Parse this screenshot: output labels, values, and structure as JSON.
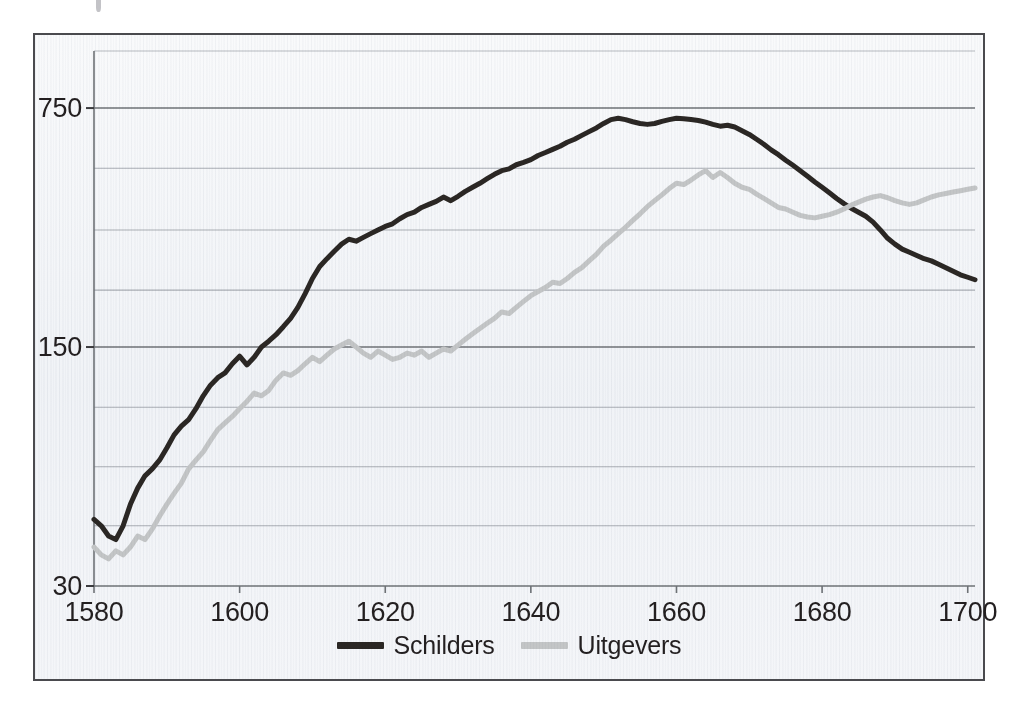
{
  "figure": {
    "frame_border_color": "#4a4a4e",
    "background_color": "#f2f4f7",
    "top_artifact_name": "scan-artifact-mark"
  },
  "legend": {
    "position": "bottom-center",
    "entries": [
      {
        "label": "Schilders",
        "color": "#2b2724",
        "swatch_name": "legend-swatch-schilders"
      },
      {
        "label": "Uitgevers",
        "color": "#c3c5c6",
        "swatch_name": "legend-swatch-uitgevers"
      }
    ]
  },
  "chart_data": {
    "type": "line",
    "title": "",
    "subtitle": "",
    "xlabel": "",
    "ylabel": "",
    "xlim": [
      1580,
      1701
    ],
    "ylim": [
      30,
      900
    ],
    "yscale": "log",
    "grid": true,
    "gridlines_y": [
      750,
      500,
      330,
      220,
      150,
      100,
      67,
      45,
      30
    ],
    "y_tick_labels": [
      "750",
      "150",
      "30"
    ],
    "y_ticks": [
      750,
      150,
      30
    ],
    "x_ticks": [
      1580,
      1600,
      1620,
      1640,
      1660,
      1680,
      1700
    ],
    "x_tick_labels": [
      "1580",
      "1600",
      "1620",
      "1640",
      "1660",
      "1680",
      "1700"
    ],
    "x": [
      1580,
      1581,
      1582,
      1583,
      1584,
      1585,
      1586,
      1587,
      1588,
      1589,
      1590,
      1591,
      1592,
      1593,
      1594,
      1595,
      1596,
      1597,
      1598,
      1599,
      1600,
      1601,
      1602,
      1603,
      1604,
      1605,
      1606,
      1607,
      1608,
      1609,
      1610,
      1611,
      1612,
      1613,
      1614,
      1615,
      1616,
      1617,
      1618,
      1619,
      1620,
      1621,
      1622,
      1623,
      1624,
      1625,
      1626,
      1627,
      1628,
      1629,
      1630,
      1631,
      1632,
      1633,
      1634,
      1635,
      1636,
      1637,
      1638,
      1639,
      1640,
      1641,
      1642,
      1643,
      1644,
      1645,
      1646,
      1647,
      1648,
      1649,
      1650,
      1651,
      1652,
      1653,
      1654,
      1655,
      1656,
      1657,
      1658,
      1659,
      1660,
      1661,
      1662,
      1663,
      1664,
      1665,
      1666,
      1667,
      1668,
      1669,
      1670,
      1671,
      1672,
      1673,
      1674,
      1675,
      1676,
      1677,
      1678,
      1679,
      1680,
      1681,
      1682,
      1683,
      1684,
      1685,
      1686,
      1687,
      1688,
      1689,
      1690,
      1691,
      1692,
      1693,
      1694,
      1695,
      1696,
      1697,
      1698,
      1699,
      1700,
      1701
    ],
    "series": [
      {
        "name": "Schilders",
        "color": "#2b2724",
        "linewidth": 5,
        "values": [
          47,
          45,
          42,
          41,
          45,
          52,
          58,
          63,
          66,
          70,
          76,
          83,
          88,
          92,
          99,
          108,
          116,
          122,
          126,
          134,
          141,
          133,
          140,
          150,
          156,
          163,
          172,
          182,
          196,
          215,
          238,
          258,
          272,
          286,
          300,
          310,
          306,
          314,
          322,
          330,
          338,
          344,
          356,
          366,
          372,
          384,
          392,
          400,
          412,
          402,
          414,
          428,
          440,
          452,
          466,
          480,
          492,
          498,
          512,
          520,
          530,
          545,
          556,
          568,
          580,
          596,
          608,
          624,
          640,
          656,
          676,
          694,
          700,
          694,
          684,
          676,
          672,
          676,
          686,
          694,
          700,
          698,
          694,
          690,
          682,
          672,
          664,
          668,
          660,
          644,
          628,
          608,
          588,
          566,
          548,
          528,
          510,
          492,
          474,
          456,
          440,
          424,
          408,
          394,
          382,
          372,
          362,
          348,
          330,
          312,
          300,
          290,
          284,
          278,
          272,
          268,
          262,
          256,
          250,
          244,
          240,
          236
        ]
      },
      {
        "name": "Uitgevers",
        "color": "#c3c5c6",
        "linewidth": 5,
        "values": [
          39,
          37,
          36,
          38,
          37,
          39,
          42,
          41,
          44,
          48,
          52,
          56,
          60,
          66,
          70,
          74,
          80,
          86,
          90,
          94,
          99,
          104,
          110,
          108,
          112,
          120,
          126,
          124,
          128,
          134,
          140,
          136,
          142,
          148,
          152,
          156,
          150,
          144,
          140,
          146,
          142,
          138,
          140,
          144,
          142,
          146,
          140,
          144,
          148,
          146,
          152,
          158,
          164,
          170,
          176,
          182,
          190,
          188,
          196,
          204,
          212,
          218,
          224,
          232,
          230,
          238,
          248,
          256,
          268,
          280,
          296,
          308,
          322,
          336,
          352,
          368,
          386,
          402,
          418,
          436,
          452,
          448,
          462,
          478,
          492,
          470,
          486,
          470,
          452,
          440,
          434,
          420,
          408,
          396,
          384,
          380,
          372,
          364,
          360,
          358,
          362,
          366,
          372,
          380,
          390,
          398,
          406,
          412,
          416,
          410,
          402,
          396,
          392,
          396,
          404,
          412,
          418,
          422,
          426,
          430,
          434,
          438
        ]
      }
    ]
  }
}
